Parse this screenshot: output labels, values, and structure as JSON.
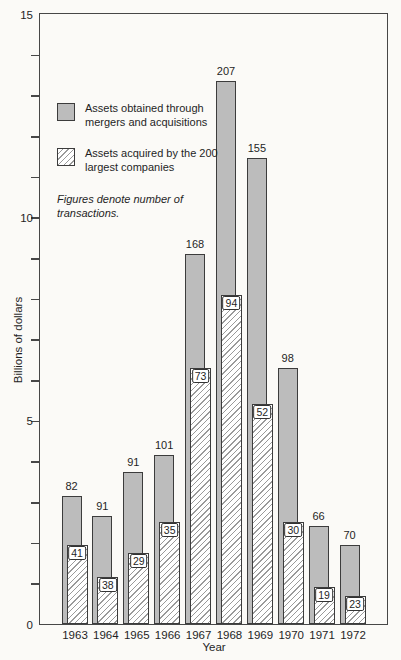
{
  "figure": {
    "background_color": "#fbfaf7"
  },
  "chart_data": {
    "type": "bar",
    "title": "",
    "xlabel": "Year",
    "ylabel": "Billions of dollars",
    "ylim": [
      0,
      15
    ],
    "ytick_labeled": [
      {
        "value": 0,
        "label": "0"
      },
      {
        "value": 5,
        "label": "5"
      },
      {
        "value": 10,
        "label": "10"
      },
      {
        "value": 15,
        "label": "15"
      }
    ],
    "minor_tick_interval": 1,
    "grid": false,
    "legend_position": "upper-left-inside",
    "note": "Figures denote number of transactions.",
    "categories": [
      "1963",
      "1964",
      "1965",
      "1966",
      "1967",
      "1968",
      "1969",
      "1970",
      "1971",
      "1972"
    ],
    "series": [
      {
        "name": "Assets obtained through mergers and acquisitions",
        "style": "solid",
        "fill": "#bcbcbc",
        "values_billions": [
          3.15,
          2.65,
          3.75,
          4.15,
          9.1,
          13.35,
          11.45,
          6.3,
          2.4,
          1.95
        ],
        "transactions": [
          82,
          91,
          91,
          101,
          168,
          207,
          155,
          98,
          66,
          70
        ]
      },
      {
        "name": "Assets acquired by the 200 largest companies",
        "style": "hatched",
        "fill": "#ffffff",
        "hatch": "diagonal-forward",
        "values_billions": [
          1.95,
          1.15,
          1.75,
          2.5,
          6.3,
          8.1,
          5.4,
          2.5,
          0.9,
          0.7
        ],
        "transactions": [
          41,
          38,
          29,
          35,
          73,
          94,
          52,
          30,
          19,
          23
        ]
      }
    ],
    "colors": {
      "bar_border": "#3c3c3c",
      "hatch_line": "#9a9a9a",
      "axis": "#474747",
      "text": "#1f1f1f",
      "background": "#fbfaf7"
    }
  }
}
